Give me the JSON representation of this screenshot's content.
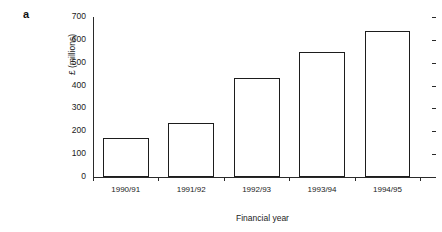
{
  "figure": {
    "panel_letter": "a"
  },
  "chart_data": {
    "type": "bar",
    "title": "",
    "categories": [
      "1990/91",
      "1991/92",
      "1992/93",
      "1993/94",
      "1994/95"
    ],
    "values": [
      170,
      235,
      435,
      547,
      640
    ],
    "series": [
      {
        "name": "",
        "values": [
          170,
          235,
          435,
          547,
          640
        ]
      }
    ],
    "xlabel": "Financial year",
    "ylabel": "£ (millions)",
    "ylim": [
      0,
      700
    ],
    "yticks": [
      0,
      100,
      200,
      300,
      400,
      500,
      600,
      700
    ],
    "ytick_labels": [
      "0",
      "100",
      "200",
      "300",
      "400",
      "500",
      "600",
      "700"
    ],
    "grid": false,
    "legend": false,
    "bar_fill_color": "#ffffff",
    "bar_edge_color": "#1d1d1d",
    "axis_color": "#2a2a2a",
    "background_color": "#ffffff"
  }
}
